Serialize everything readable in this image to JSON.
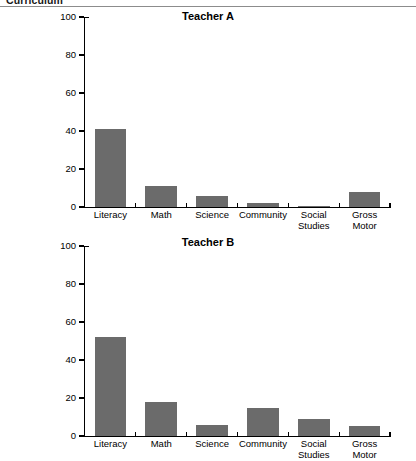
{
  "header": {
    "title": "Curriculum"
  },
  "chart_data": [
    {
      "id": "teacher-a",
      "type": "bar",
      "title": "Teacher A",
      "xlabel": "",
      "ylabel": "",
      "ylim": [
        0,
        100
      ],
      "yticks": [
        0,
        20,
        40,
        60,
        80,
        100
      ],
      "ytick_labels": [
        "0",
        "20",
        "40",
        "60",
        "80",
        "100"
      ],
      "grid": false,
      "legend": "none",
      "bar_color": "#6b6b6b",
      "categories": [
        "Literacy",
        "Math",
        "Science",
        "Community",
        "Social\nStudies",
        "Gross\nMotor"
      ],
      "values": [
        41,
        11,
        6,
        2,
        0.5,
        8
      ]
    },
    {
      "id": "teacher-b",
      "type": "bar",
      "title": "Teacher B",
      "xlabel": "",
      "ylabel": "",
      "ylim": [
        0,
        100
      ],
      "yticks": [
        0,
        20,
        40,
        60,
        80,
        100
      ],
      "ytick_labels": [
        "0",
        "20",
        "40",
        "60",
        "80",
        "100"
      ],
      "grid": false,
      "legend": "none",
      "bar_color": "#6b6b6b",
      "categories": [
        "Literacy",
        "Math",
        "Science",
        "Community",
        "Social\nStudies",
        "Gross\nMotor"
      ],
      "values": [
        52,
        18,
        6,
        15,
        9,
        5.5
      ]
    }
  ]
}
